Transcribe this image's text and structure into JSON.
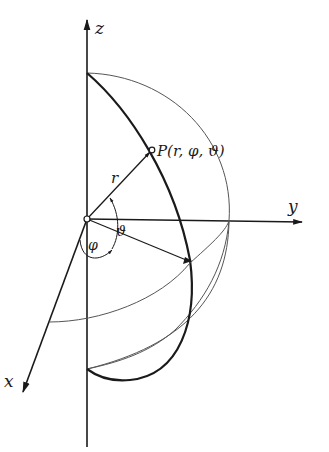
{
  "figure": {
    "labels": {
      "z_axis": "z",
      "y_axis": "y",
      "x_axis": "x",
      "radius": "r",
      "point": "P(r, φ, ϑ)",
      "phi": "φ",
      "theta": "ϑ"
    },
    "colors": {
      "ink": "#1a1a1a",
      "thin": "#555555",
      "background": "#ffffff"
    }
  }
}
